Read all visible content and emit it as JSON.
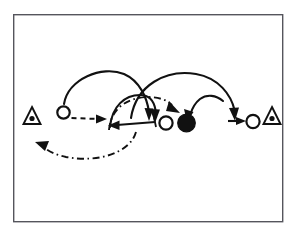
{
  "figure": {
    "background_color": "#ffffff",
    "ink_color": "#111111",
    "frame": {
      "label": "diagram-frame",
      "stroke_color": "#55555c",
      "x": 13,
      "y": 14,
      "width": 270,
      "height": 208
    },
    "markers": [
      {
        "id": "triangle-left",
        "kind": "triangle-with-dot",
        "label": "left boundary marker",
        "x": 32,
        "y": 118,
        "size": 13,
        "fill": "#ffffff",
        "dot_fill": "#111111"
      },
      {
        "id": "triangle-right",
        "kind": "triangle-with-dot",
        "label": "right boundary marker",
        "x": 272,
        "y": 118,
        "size": 13,
        "fill": "#ffffff",
        "dot_fill": "#111111"
      },
      {
        "id": "circle-open-left",
        "kind": "open-circle",
        "label": "left open node",
        "x": 62,
        "y": 113,
        "radius": 6.5,
        "fill": "#ffffff",
        "stroke": "#111111"
      },
      {
        "id": "circle-open-mid",
        "kind": "open-circle",
        "label": "middle open node",
        "x": 166,
        "y": 123,
        "radius": 7.0,
        "fill": "#ffffff",
        "stroke": "#111111"
      },
      {
        "id": "circle-filled",
        "kind": "filled-circle",
        "label": "filled target node",
        "x": 186,
        "y": 123,
        "radius": 9.0,
        "fill": "#111111",
        "stroke": "#111111"
      },
      {
        "id": "circle-open-right",
        "kind": "open-circle",
        "label": "right open node",
        "x": 253,
        "y": 122,
        "radius": 7.0,
        "fill": "#ffffff",
        "stroke": "#111111"
      }
    ],
    "paths": [
      {
        "id": "arc-solid-left",
        "style": "solid",
        "label": "left solid arc sweeping right and down",
        "d": "M 63 105 C 66 80 100 66 122 74 C 138 80 146 97 148 113",
        "arrowhead": {
          "x": 148,
          "y": 118,
          "angle_deg": 100
        }
      },
      {
        "id": "arrow-dashed-left",
        "style": "dashed",
        "label": "dashed arrow pointing right",
        "d": "M 72 118 L 100 119",
        "arrowhead": {
          "x": 104,
          "y": 119,
          "angle_deg": 0
        }
      },
      {
        "id": "arc-dashdot-lower",
        "style": "dash-dot",
        "label": "lower dash-dot return curve pointing left",
        "d": "M 132 133 C 126 152 96 162 64 156 C 55 154 48 151 44 148",
        "arrowhead": {
          "x": 39,
          "y": 145,
          "angle_deg": 203
        }
      },
      {
        "id": "arc-dashdot-upper",
        "style": "dash-dot",
        "label": "upper dash-dot curve toward filled node",
        "d": "M 110 131 C 112 110 126 99 146 98 C 158 98 166 101 171 106",
        "arrowhead": {
          "x": 176,
          "y": 111,
          "angle_deg": 45
        }
      },
      {
        "id": "arc-solid-mid",
        "style": "solid",
        "label": "middle solid arc descending to the left corner",
        "d": "M 110 128 C 112 108 124 97 139 96 C 148 96 153 101 155 110",
        "arrowhead": {
          "x": 155,
          "y": 116,
          "angle_deg": 95
        }
      },
      {
        "id": "arrow-solid-left",
        "style": "solid",
        "label": "solid horizontal arrow pointing left",
        "d": "M 155 122 L 116 125",
        "arrowhead": {
          "x": 110,
          "y": 125,
          "angle_deg": 185
        }
      },
      {
        "id": "arc-solid-right-inner",
        "style": "solid",
        "label": "right solid arc descending into filled node",
        "d": "M 222 102 C 216 96 207 95 200 100 C 195 104 192 110 190 115",
        "arrowhead": {
          "x": 188,
          "y": 120,
          "angle_deg": 112
        }
      },
      {
        "id": "arc-solid-right-outer",
        "style": "solid",
        "label": "long right solid arc over to the right node",
        "d": "M 131 117 C 135 86 165 70 195 74 C 218 78 230 95 234 112",
        "arrowhead": {
          "x": 235,
          "y": 118,
          "angle_deg": 80
        }
      },
      {
        "id": "arrow-solid-right",
        "style": "solid",
        "label": "short solid arrow entering right node",
        "d": "M 228 121 L 240 121",
        "arrowhead": {
          "x": 245,
          "y": 121,
          "angle_deg": 0
        }
      }
    ]
  }
}
